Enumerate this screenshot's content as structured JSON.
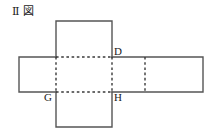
{
  "figure": {
    "caption_roman": "Ⅱ",
    "caption_kanji": "図",
    "caption_full": "Ⅱ 図",
    "stroke_color": "#555555",
    "dashed_color": "#3a3a3a",
    "background_color": "#ffffff",
    "text_color": "#1a1a1a"
  },
  "geometry": {
    "canvas_width": 212,
    "canvas_height": 130,
    "cell_size": 56,
    "top_square": {
      "x": 56,
      "y": 21,
      "width": 56,
      "height": 36
    },
    "band": {
      "x": 19,
      "y": 57,
      "width": 184,
      "height": 35
    },
    "bottom_square": {
      "x": 56,
      "y": 92,
      "width": 56,
      "height": 35
    },
    "dashed_vertical_left": {
      "x": 56,
      "y1": 57,
      "y2": 92
    },
    "dashed_vertical_center": {
      "x": 112,
      "y1": 57,
      "y2": 92
    },
    "dashed_vertical_right": {
      "x": 145,
      "y1": 57,
      "y2": 92
    },
    "dashed_horizontal_top": {
      "y": 57,
      "x1": 56,
      "x2": 112
    },
    "dashed_horizontal_bottom": {
      "y": 92,
      "x1": 56,
      "x2": 112
    }
  },
  "labels": {
    "d": {
      "text": "D",
      "x": 114,
      "y": 46
    },
    "g": {
      "text": "G",
      "x": 44,
      "y": 92
    },
    "h": {
      "text": "H",
      "x": 114,
      "y": 92
    }
  }
}
